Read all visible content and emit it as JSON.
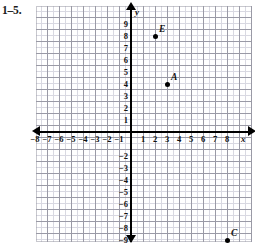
{
  "exercise": {
    "label": "1–5."
  },
  "graph": {
    "axis_names": {
      "x": "x",
      "y": "y"
    },
    "x_ticks": [
      {
        "label": "−8",
        "value": -8
      },
      {
        "label": "−7",
        "value": -7
      },
      {
        "label": "−6",
        "value": -6
      },
      {
        "label": "−5",
        "value": -5
      },
      {
        "label": "−4",
        "value": -4
      },
      {
        "label": "−3",
        "value": -3
      },
      {
        "label": "−2",
        "value": -2
      },
      {
        "label": "−1",
        "value": -1
      },
      {
        "label": "1",
        "value": 1
      },
      {
        "label": "2",
        "value": 2
      },
      {
        "label": "3",
        "value": 3
      },
      {
        "label": "4",
        "value": 4
      },
      {
        "label": "5",
        "value": 5
      },
      {
        "label": "6",
        "value": 6
      },
      {
        "label": "7",
        "value": 7
      },
      {
        "label": "8",
        "value": 8
      }
    ],
    "y_ticks": [
      {
        "label": "9",
        "value": 9
      },
      {
        "label": "8",
        "value": 8
      },
      {
        "label": "7",
        "value": 7
      },
      {
        "label": "6",
        "value": 6
      },
      {
        "label": "5",
        "value": 5
      },
      {
        "label": "4",
        "value": 4
      },
      {
        "label": "3",
        "value": 3
      },
      {
        "label": "2",
        "value": 2
      },
      {
        "label": "1",
        "value": 1
      },
      {
        "label": "−2",
        "value": -2
      },
      {
        "label": "−3",
        "value": -3
      },
      {
        "label": "−4",
        "value": -4
      },
      {
        "label": "−5",
        "value": -5
      },
      {
        "label": "−6",
        "value": -6
      },
      {
        "label": "−7",
        "value": -7
      },
      {
        "label": "−8",
        "value": -8
      },
      {
        "label": "−9",
        "value": -9
      }
    ],
    "points": [
      {
        "label": "E",
        "x": 2,
        "y": 8
      },
      {
        "label": "A",
        "x": 3,
        "y": 4
      },
      {
        "label": "C",
        "x": 8,
        "y": -9
      }
    ]
  },
  "chart_data": {
    "type": "scatter",
    "title": "",
    "xlabel": "x",
    "ylabel": "y",
    "xlim": [
      -8.8,
      9.2
    ],
    "ylim": [
      -9.8,
      9.4
    ],
    "grid": true,
    "minor_grid_step": 0.5,
    "major_grid_step": 1,
    "legend": "none",
    "series": [
      {
        "name": "plotted points",
        "points": [
          {
            "label": "E",
            "x": 2,
            "y": 8
          },
          {
            "label": "A",
            "x": 3,
            "y": 4
          },
          {
            "label": "C",
            "x": 8,
            "y": -9
          }
        ]
      }
    ]
  }
}
